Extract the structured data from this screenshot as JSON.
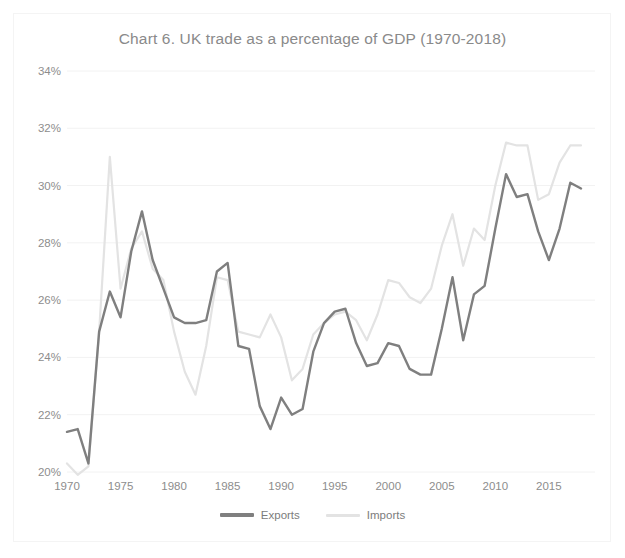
{
  "chart": {
    "title": "Chart 6. UK trade as a percentage of GDP (1970-2018)",
    "y_ticks": [
      "20%",
      "22%",
      "24%",
      "26%",
      "28%",
      "30%",
      "32%",
      "34%"
    ],
    "x_ticks": [
      "1970",
      "1975",
      "1980",
      "1985",
      "1990",
      "1995",
      "2000",
      "2005",
      "2010",
      "2015"
    ],
    "legend": [
      {
        "label": "Exports",
        "color": "#7f7f7f"
      },
      {
        "label": "Imports",
        "color": "#e3e3e3"
      }
    ]
  },
  "chart_data": {
    "type": "line",
    "title": "Chart 6. UK trade as a percentage of GDP (1970-2018)",
    "xlabel": "",
    "ylabel": "",
    "xlim": [
      1970,
      2018
    ],
    "ylim": [
      20,
      34
    ],
    "grid": true,
    "legend_position": "bottom",
    "x_tick_labels": [
      "1970",
      "1975",
      "1980",
      "1985",
      "1990",
      "1995",
      "2000",
      "2005",
      "2010",
      "2015"
    ],
    "x_tick_values": [
      1970,
      1975,
      1980,
      1985,
      1990,
      1995,
      2000,
      2005,
      2010,
      2015
    ],
    "y_tick_labels": [
      "20%",
      "22%",
      "24%",
      "26%",
      "28%",
      "30%",
      "32%",
      "34%"
    ],
    "y_tick_values": [
      20,
      22,
      24,
      26,
      28,
      30,
      32,
      34
    ],
    "x": [
      1970,
      1971,
      1972,
      1973,
      1974,
      1975,
      1976,
      1977,
      1978,
      1979,
      1980,
      1981,
      1982,
      1983,
      1984,
      1985,
      1986,
      1987,
      1988,
      1989,
      1990,
      1991,
      1992,
      1993,
      1994,
      1995,
      1996,
      1997,
      1998,
      1999,
      2000,
      2001,
      2002,
      2003,
      2004,
      2005,
      2006,
      2007,
      2008,
      2009,
      2010,
      2011,
      2012,
      2013,
      2014,
      2015,
      2016,
      2017,
      2018
    ],
    "series": [
      {
        "name": "Exports",
        "color": "#7f7f7f",
        "width": 2.4,
        "values": [
          21.4,
          21.5,
          20.3,
          24.9,
          26.3,
          25.4,
          27.7,
          29.1,
          27.4,
          26.4,
          25.4,
          25.2,
          25.2,
          25.3,
          27.0,
          27.3,
          24.4,
          24.3,
          22.3,
          21.5,
          22.6,
          22.0,
          22.2,
          24.2,
          25.2,
          25.6,
          25.7,
          24.5,
          23.7,
          23.8,
          24.5,
          24.4,
          23.6,
          23.4,
          23.4,
          25.0,
          26.8,
          24.6,
          26.2,
          26.5,
          28.5,
          30.4,
          29.6,
          29.7,
          28.4,
          27.4,
          28.5,
          30.1,
          29.9
        ]
      },
      {
        "name": "Imports",
        "color": "#e3e3e3",
        "width": 2.2,
        "values": [
          20.3,
          19.9,
          20.2,
          24.9,
          31.0,
          26.4,
          27.8,
          28.4,
          27.1,
          26.7,
          24.9,
          23.5,
          22.7,
          24.4,
          26.8,
          26.7,
          24.9,
          24.8,
          24.7,
          25.5,
          24.7,
          23.2,
          23.6,
          24.8,
          25.2,
          25.5,
          25.6,
          25.3,
          24.6,
          25.5,
          26.7,
          26.6,
          26.1,
          25.9,
          26.4,
          27.9,
          29.0,
          27.2,
          28.5,
          28.1,
          30.0,
          31.5,
          31.4,
          31.4,
          29.5,
          29.7,
          30.8,
          31.4,
          31.4
        ]
      }
    ]
  }
}
